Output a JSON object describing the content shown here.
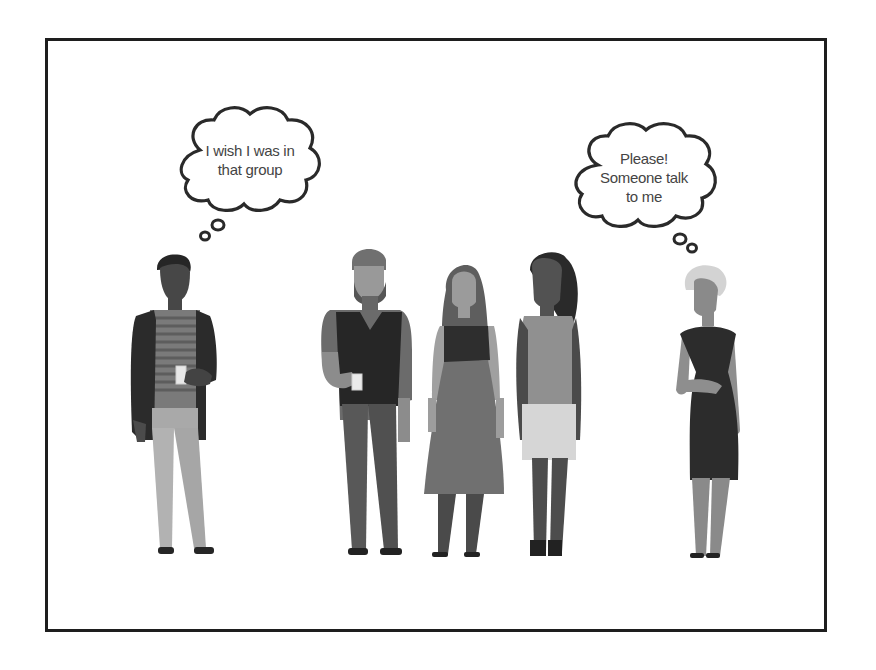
{
  "illustration": {
    "description": "Social exclusion scene: two isolated people with thought bubbles and a group of three in the middle",
    "frame_color": "#1e1e1e",
    "background": "#ffffff"
  },
  "thought_bubbles": [
    {
      "id": "left",
      "lines": [
        "I wish I was in",
        "that group"
      ]
    },
    {
      "id": "right",
      "lines": [
        "Please!",
        "Someone talk",
        "to me"
      ]
    }
  ],
  "people": [
    {
      "id": "left-man",
      "role": "isolated",
      "description": "man with striped shirt, dark cardigan, light trousers, holding cup"
    },
    {
      "id": "bearded-man",
      "role": "group",
      "description": "bearded man in dark vest, holding cup"
    },
    {
      "id": "woman-skirt",
      "role": "group",
      "description": "long-haired woman in dark top and flared skirt"
    },
    {
      "id": "woman-ponytail",
      "role": "group",
      "description": "woman with ponytail, fitted top and light skirt"
    },
    {
      "id": "right-woman",
      "role": "isolated",
      "description": "blonde short-haired woman in dark fitted dress"
    }
  ]
}
